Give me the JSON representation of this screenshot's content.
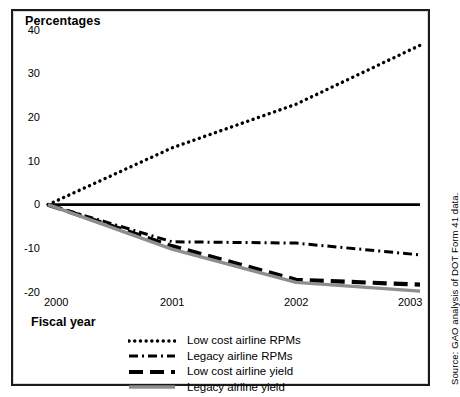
{
  "figure": {
    "title": "Percentages",
    "x_axis_title": "Fiscal year",
    "source": "Source: GAO analysis of DOT Form 41 data."
  },
  "colors": {
    "ink": "#000000",
    "frame": "#1b1b1b",
    "legacy_yield_gray": "#8e8e8e",
    "background": "#ffffff"
  },
  "chart_data": {
    "type": "line",
    "title": "Percentages",
    "xlabel": "Fiscal year",
    "ylabel": "Percentages",
    "x": [
      "2000",
      "2001",
      "2002",
      "2003"
    ],
    "categories": [
      "2000",
      "2001",
      "2002",
      "2003"
    ],
    "xlim": [
      "2000",
      "2003"
    ],
    "ylim": [
      -20,
      40
    ],
    "yticks": [
      40,
      30,
      20,
      10,
      0,
      -10,
      -20
    ],
    "ytick_labels": [
      "40",
      "30",
      "20",
      "10",
      "0",
      "-10",
      "-20"
    ],
    "xtick_labels": [
      "2000",
      "2001",
      "2002",
      "2003"
    ],
    "grid": false,
    "legend_position": "bottom",
    "zero_line": true,
    "series": [
      {
        "name": "Low cost airline RPMs",
        "style": "dotted",
        "color": "#000000",
        "values": [
          0,
          13,
          23,
          36.5
        ]
      },
      {
        "name": "Legacy airline RPMs",
        "style": "dash-dot",
        "color": "#000000",
        "values": [
          0,
          -8.5,
          -8.8,
          -11.5
        ]
      },
      {
        "name": "Low cost airline yield",
        "style": "dashed",
        "color": "#000000",
        "values": [
          0,
          -9.5,
          -17.2,
          -18.3
        ]
      },
      {
        "name": "Legacy airline yield",
        "style": "solid",
        "color": "#8e8e8e",
        "values": [
          0,
          -10.2,
          -17.8,
          -19.8
        ]
      }
    ]
  },
  "y_ticks": [
    {
      "label": "40",
      "value": 40
    },
    {
      "label": "30",
      "value": 30
    },
    {
      "label": "20",
      "value": 20
    },
    {
      "label": "10",
      "value": 10
    },
    {
      "label": "0",
      "value": 0
    },
    {
      "label": "-10",
      "value": -10
    },
    {
      "label": "-20",
      "value": -20
    }
  ],
  "x_ticks": [
    {
      "label": "2000",
      "value": 0
    },
    {
      "label": "2001",
      "value": 1
    },
    {
      "label": "2002",
      "value": 2
    },
    {
      "label": "2003",
      "value": 3
    }
  ],
  "legend": {
    "items": [
      {
        "label": "Low cost airline RPMs",
        "style": "dotted",
        "color": "#000000"
      },
      {
        "label": "Legacy airline RPMs",
        "style": "dash-dot",
        "color": "#000000"
      },
      {
        "label": "Low cost airline yield",
        "style": "dashed",
        "color": "#000000"
      },
      {
        "label": "Legacy airline yield",
        "style": "solid",
        "color": "#8e8e8e"
      }
    ]
  }
}
